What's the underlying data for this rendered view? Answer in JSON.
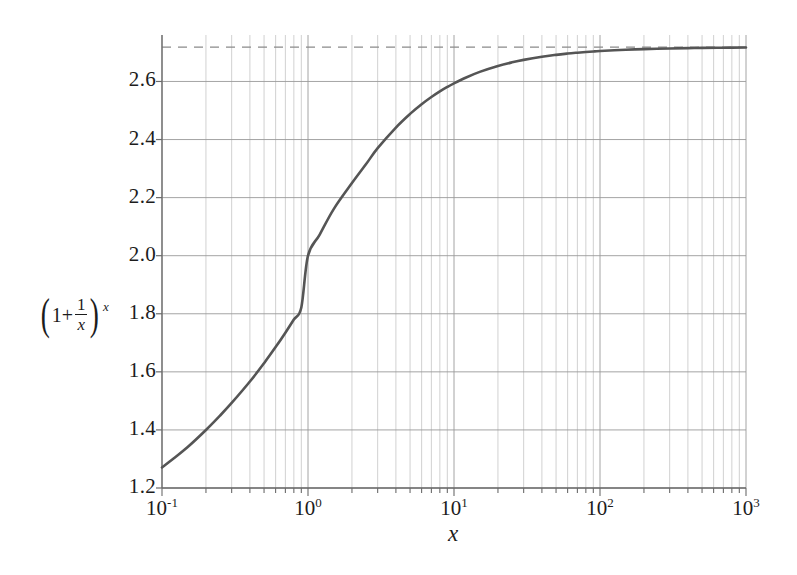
{
  "chart_data": {
    "type": "line",
    "title": "",
    "subtitle": "",
    "xlabel": "x",
    "ylabel": "(1+1/x)^x",
    "xscale": "log",
    "yscale": "linear",
    "xlim": [
      0.1,
      1000
    ],
    "ylim": [
      1.2,
      2.76
    ],
    "grid": true,
    "grid_minor": true,
    "legend": false,
    "legend_position": "none",
    "x_tick_labels": [
      "10⁻¹",
      "10⁰",
      "10¹",
      "10²",
      "10³"
    ],
    "x_tick_values": [
      0.1,
      1,
      10,
      100,
      1000
    ],
    "x_tick_mantissas": [
      "1",
      "1",
      "1",
      "1",
      "1"
    ],
    "x_tick_exponents": [
      "-1",
      "0",
      "1",
      "2",
      "3"
    ],
    "y_tick_labels": [
      "1.2",
      "1.4",
      "1.6",
      "1.8",
      "2.0",
      "2.2",
      "2.4",
      "2.6"
    ],
    "y_tick_values": [
      1.2,
      1.4,
      1.6,
      1.8,
      2.0,
      2.2,
      2.4,
      2.6
    ],
    "series": [
      {
        "name": "(1+1/x)^x",
        "color": "#555555",
        "style": "solid",
        "width": 2.6,
        "x": [
          0.1,
          0.12,
          0.15,
          0.2,
          0.25,
          0.3,
          0.4,
          0.5,
          0.6,
          0.7,
          0.8,
          0.9,
          1.0,
          1.2,
          1.5,
          2.0,
          2.5,
          3.0,
          4.0,
          5.0,
          6.0,
          7.0,
          8.0,
          9.0,
          10.0,
          12.0,
          15.0,
          20.0,
          25.0,
          30.0,
          40.0,
          50.0,
          60.0,
          70.0,
          80.0,
          90.0,
          100.0,
          150.0,
          200.0,
          300.0,
          400.0,
          500.0,
          700.0,
          1000.0
        ],
        "y": [
          1.2709,
          1.3018,
          1.3412,
          1.3998,
          1.4495,
          1.4928,
          1.5666,
          1.6298,
          1.6852,
          1.7349,
          1.7802,
          1.8219,
          2.0,
          2.072,
          2.1605,
          2.25,
          2.3154,
          2.3703,
          2.4414,
          2.4883,
          2.5216,
          2.5465,
          2.5658,
          2.5812,
          2.5937,
          2.613,
          2.633,
          2.6533,
          2.6658,
          2.6743,
          2.6851,
          2.6916,
          2.696,
          2.6991,
          2.7015,
          2.7034,
          2.7048,
          2.7091,
          2.7115,
          2.7137,
          2.7149,
          2.7156,
          2.7163,
          2.7169
        ]
      }
    ],
    "annotations": [
      {
        "name": "asymptote",
        "type": "hline",
        "value": 2.71828,
        "label": "",
        "style": "dashed",
        "color": "#8a8a8a"
      }
    ],
    "colors": {
      "curve": "#555555",
      "asymptote": "#8a8a8a",
      "grid_major": "#9a9a9a",
      "grid_minor": "#bdbdbd",
      "axis": "#6b6b6b",
      "text": "#1c1c1c",
      "background": "#ffffff"
    }
  },
  "ylabel_parts": {
    "open_paren": "(",
    "one_plus": "1+",
    "numerator": "1",
    "denominator": "x",
    "close_paren": ")",
    "exponent": "x"
  },
  "xlabel_text": "x"
}
